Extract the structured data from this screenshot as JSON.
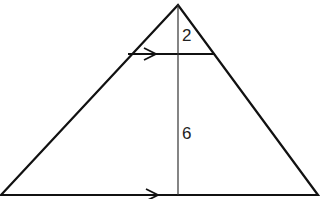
{
  "diagram": {
    "type": "geometry-similar-triangles",
    "labels": {
      "top_height": "2",
      "lower_height": "6"
    },
    "colors": {
      "stroke": "#111111",
      "background": "#ffffff"
    },
    "shapes": {
      "apex": [
        178,
        5
      ],
      "base_left": [
        1,
        195
      ],
      "base_right": [
        318,
        195
      ],
      "parallel_segment": {
        "y": 54,
        "x1": 128,
        "x2": 215
      },
      "altitude": {
        "x": 178,
        "y1": 5,
        "y2": 195
      }
    },
    "markers": [
      "parallel-arrow-top",
      "parallel-arrow-base"
    ]
  }
}
